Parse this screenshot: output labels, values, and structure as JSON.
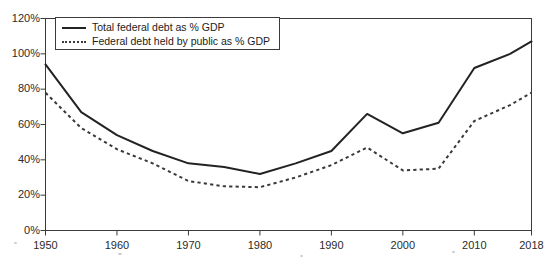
{
  "chart_data": {
    "type": "line",
    "title": "",
    "subtitle": "",
    "xlabel": "",
    "ylabel": "",
    "x": [
      1950,
      1955,
      1960,
      1965,
      1970,
      1975,
      1980,
      1985,
      1990,
      1995,
      2000,
      2005,
      2010,
      2015,
      2018
    ],
    "xlim": [
      1950,
      2018
    ],
    "ylim": [
      0,
      120
    ],
    "x_tick_labels": [
      "1950",
      "1960",
      "1970",
      "1980",
      "1990",
      "2000",
      "2010",
      "2018"
    ],
    "x_tick_values": [
      1950,
      1960,
      1970,
      1980,
      1990,
      2000,
      2010,
      2018
    ],
    "y_tick_labels": [
      "0%",
      "20%",
      "40%",
      "60%",
      "80%",
      "100%",
      "120%"
    ],
    "y_tick_values": [
      0,
      20,
      40,
      60,
      80,
      100,
      120
    ],
    "grid": false,
    "legend_position": "top-left",
    "series": [
      {
        "name": "Total federal debt as % GDP",
        "style": "solid",
        "color": "#222222",
        "values": [
          94,
          67,
          54,
          45,
          38,
          36,
          32,
          38,
          45,
          66,
          55,
          61,
          92,
          100,
          107
        ]
      },
      {
        "name": "Federal debt held by public as % GDP",
        "style": "dotted",
        "color": "#3a3a3a",
        "values": [
          78,
          58,
          46,
          38,
          28,
          25,
          24.5,
          30,
          37,
          47,
          34,
          35,
          62,
          71,
          78
        ]
      }
    ]
  },
  "legend": {
    "items": [
      {
        "label": "Total federal debt as % GDP",
        "style": "solid"
      },
      {
        "label": "Federal debt held by public as % GDP",
        "style": "dotted"
      }
    ]
  },
  "axes": {
    "y_labels": [
      "120%",
      "100%",
      "80%",
      "60%",
      "40%",
      "20%",
      "0%"
    ],
    "x_labels": [
      "1950",
      "1960",
      "1970",
      "1980",
      "1990",
      "2000",
      "2010",
      "2018"
    ]
  },
  "colors": {
    "series_total": "#222222",
    "series_public": "#3a3a3a",
    "axis": "#3a3a3a",
    "background": "#ffffff",
    "text": "#1c1c1c"
  }
}
